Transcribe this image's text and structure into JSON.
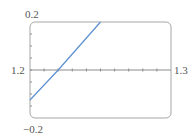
{
  "chart_data": {
    "type": "line",
    "title": "",
    "xlabel": "",
    "ylabel": "",
    "xlim": [
      1.2,
      1.3
    ],
    "ylim": [
      -0.2,
      0.2
    ],
    "x_tick_labels": [
      "1.2",
      "1.3"
    ],
    "y_tick_labels": [
      "0.2",
      "-0.2"
    ],
    "x_minor_tick_step": 0.01,
    "y_minor_tick_step": 0.05,
    "grid": false,
    "legend": null,
    "series": [
      {
        "name": "f(x)",
        "color": "#5b8fd0",
        "x": [
          1.2,
          1.22,
          1.25
        ],
        "y": [
          -0.125,
          0.0,
          0.2
        ]
      }
    ]
  },
  "labels": {
    "y_max": "0.2",
    "y_min": "−0.2",
    "x_min": "1.2",
    "x_max": "1.3"
  },
  "colors": {
    "frame": "#a6a6a6",
    "axis": "#8c8c8c",
    "line": "#5b8fd0",
    "text": "#555555"
  }
}
